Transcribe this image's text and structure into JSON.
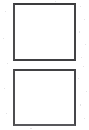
{
  "canvas": {
    "width": 89,
    "height": 130,
    "background_color": "#ffffff",
    "description": "Two empty square outlines stacked vertically on a blank white sheet"
  },
  "style": {
    "ink_color": "#3b3b3d",
    "ink_color_secondary": "#58585c",
    "fill_color": "#ffffff",
    "stroke_width_px": 2,
    "appearance": "scanned hand-ruled outline"
  },
  "shapes": [
    {
      "name": "box-top",
      "label": "",
      "type": "rectangle",
      "fill": "#ffffff",
      "stroke": "#3b3b3d",
      "stroke_width_px": 2,
      "x": 13,
      "y": 3,
      "width": 63,
      "height": 58,
      "content": ""
    },
    {
      "name": "box-bottom",
      "label": "",
      "type": "rectangle",
      "fill": "#ffffff",
      "stroke": "#414143",
      "stroke_width_px": 2,
      "x": 13,
      "y": 69,
      "width": 63,
      "height": 57,
      "content": ""
    }
  ],
  "layout": {
    "gap_between_boxes_px": 8,
    "left_margin_px": 13,
    "right_margin_px": 13,
    "top_margin_px": 3,
    "bottom_margin_px": 4
  }
}
